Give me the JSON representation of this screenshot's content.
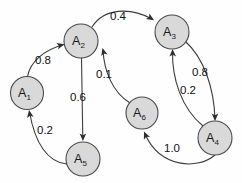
{
  "figure": {
    "kind": "directed-weighted-graph",
    "background_color": "#fefefe",
    "node_fill_color": "#d9d9d9",
    "node_stroke_color": "#4a4a4a",
    "edge_color": "#3c3c3c",
    "label_color": "#111111"
  },
  "nodes": [
    {
      "id": "A1",
      "base": "A",
      "sub": "1",
      "cx": 27,
      "cy": 93,
      "r": 16.5
    },
    {
      "id": "A2",
      "base": "A",
      "sub": "2",
      "cx": 81,
      "cy": 41,
      "r": 17.0
    },
    {
      "id": "A3",
      "base": "A",
      "sub": "3",
      "cx": 172,
      "cy": 32,
      "r": 17.0
    },
    {
      "id": "A4",
      "base": "A",
      "sub": "4",
      "cx": 215,
      "cy": 138,
      "r": 17.0
    },
    {
      "id": "A5",
      "base": "A",
      "sub": "5",
      "cx": 83,
      "cy": 159,
      "r": 17.0
    },
    {
      "id": "A6",
      "base": "A",
      "sub": "6",
      "cx": 142,
      "cy": 113,
      "r": 16.0
    }
  ],
  "edges": [
    {
      "id": "e-a1-a2",
      "from": "A1",
      "to": "A2",
      "weight": "0.8",
      "label_x": 43,
      "label_y": 60,
      "path": "M 27.5 76.5 C 30 62 44 50 63.5 44.5",
      "arrow_x": 64.5,
      "arrow_y": 44.2,
      "arrow_angle": -15
    },
    {
      "id": "e-a2-a3",
      "from": "A2",
      "to": "A3",
      "weight": "0.4",
      "label_x": 118,
      "label_y": 16,
      "path": "M 92 27 C 104 8 130 7 152 19",
      "arrow_x": 154,
      "arrow_y": 20.2,
      "arrow_angle": 32
    },
    {
      "id": "e-a2-a5",
      "from": "A2",
      "to": "A5",
      "weight": "0.6",
      "label_x": 78,
      "label_y": 97,
      "path": "M 81.5 58 L 82.8 139",
      "arrow_x": 82.9,
      "arrow_y": 141,
      "arrow_angle": 90
    },
    {
      "id": "e-a5-a1",
      "from": "A5",
      "to": "A1",
      "weight": "0.2",
      "label_x": 45,
      "label_y": 130,
      "path": "M 66.5 164 C 48 162 35 144 29.5 112",
      "arrow_x": 29,
      "arrow_y": 110,
      "arrow_angle": -100
    },
    {
      "id": "e-a6-a2",
      "from": "A6",
      "to": "A2",
      "weight": "0.1",
      "label_x": 104,
      "label_y": 74,
      "path": "M 130 103 C 112 92 104 70 103 50",
      "arrow_x": 102.5,
      "arrow_y": 48,
      "arrow_angle": -105
    },
    {
      "id": "e-a4-a3",
      "from": "A4",
      "to": "A3",
      "weight": "0.2",
      "label_x": 188,
      "label_y": 90,
      "path": "M 203 126 C 181 108 172 78 172.5 51",
      "arrow_x": 172.5,
      "arrow_y": 49,
      "arrow_angle": -92
    },
    {
      "id": "e-a3-a4",
      "from": "A3",
      "to": "A4",
      "weight": "0.8",
      "label_x": 200,
      "label_y": 72,
      "path": "M 185 41 C 204 58 214 88 215 119",
      "arrow_x": 215,
      "arrow_y": 121,
      "arrow_angle": 90
    },
    {
      "id": "e-a4-a6",
      "from": "A4",
      "to": "A6",
      "weight": "1.0",
      "label_x": 172,
      "label_y": 148,
      "path": "M 215 155 C 198 170 160 168 145 134",
      "arrow_x": 144,
      "arrow_y": 131.5,
      "arrow_angle": -113
    }
  ]
}
